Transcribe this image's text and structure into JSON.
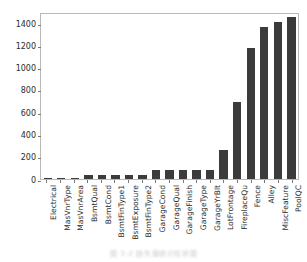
{
  "chart_data": {
    "type": "bar",
    "title": "",
    "subtitle": "",
    "xlabel": "",
    "ylabel": "",
    "ylim": [
      0,
      1500
    ],
    "yticks": [
      0,
      200,
      400,
      600,
      800,
      1000,
      1200,
      1400
    ],
    "ytick_labels": [
      "0",
      "200",
      "400",
      "600",
      "800",
      "1000",
      "1200",
      "1400"
    ],
    "grid": false,
    "legend": null,
    "legend_position": "none",
    "bar_color": "#3b3b3b",
    "categories": [
      "Electrical",
      "MasVnrType",
      "MasVnrArea",
      "BsmtQual",
      "BsmtCond",
      "BsmtFinType1",
      "BsmtExposure",
      "BsmtFinType2",
      "GarageCond",
      "GarageQual",
      "GarageFinish",
      "GarageType",
      "GarageYrBlt",
      "LotFrontage",
      "FireplaceQu",
      "Fence",
      "Alley",
      "MiscFeature",
      "PoolQC"
    ],
    "values": [
      1,
      8,
      8,
      37,
      37,
      37,
      38,
      38,
      81,
      81,
      81,
      81,
      81,
      259,
      690,
      1179,
      1369,
      1406,
      1453
    ]
  },
  "caption": {
    "text": "图 3-2  缺失值统计柱状图"
  }
}
